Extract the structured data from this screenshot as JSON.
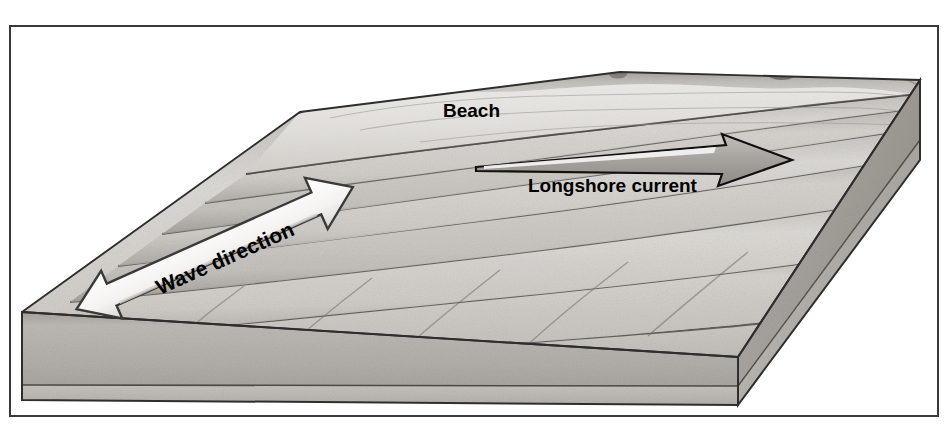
{
  "figure": {
    "type": "geomorphology-block-diagram",
    "medium": "pencil-shaded grayscale illustration",
    "frame": {
      "border_color": "#3a3a3a",
      "border_width_px": 2,
      "x": 9,
      "y": 25,
      "width": 930,
      "height": 392
    },
    "background_color": "#ffffff"
  },
  "labels": {
    "beach": {
      "text": "Beach",
      "x": 443,
      "y": 117,
      "font_size": 19,
      "rotation": 0,
      "color": "#000000"
    },
    "longshore_current": {
      "text": "Longshore current",
      "x": 528,
      "y": 192,
      "font_size": 19,
      "rotation": 0,
      "color": "#000000"
    },
    "wave_direction": {
      "text": "Wave direction",
      "x": 160,
      "y": 295,
      "font_size": 21,
      "rotation": -24,
      "color": "#000000"
    }
  },
  "arrows": {
    "longshore_current_arrow": {
      "name": "longshore-current-arrow",
      "direction": "right",
      "style": "slender single-headed",
      "fill": "#a8a8a8",
      "stroke": "#000000",
      "tail_x": 476,
      "tail_y": 166,
      "tip_x": 792,
      "tip_y": 160
    },
    "wave_direction_arrow": {
      "name": "wave-direction-arrow",
      "direction": "double-headed diagonal",
      "style": "wide white ribbon",
      "fill": "#ffffff",
      "stroke": "#333333",
      "tail_x": 72,
      "tail_y": 300,
      "tip_x": 356,
      "tip_y": 198,
      "rotation_deg": -24
    }
  },
  "colors": {
    "sand_light": "#e8e6e2",
    "sand_mid": "#d3d0cb",
    "water_light": "#d8d6d2",
    "water_mid": "#bfbcb7",
    "water_dark": "#9e9b96",
    "block_face": "#b6b3ae",
    "block_face_lower": "#c9c6c1",
    "block_side": "#a9a6a1",
    "outline": "#2e2e2e",
    "dune_crest": "#6e6b66"
  },
  "geometry": {
    "block": {
      "top_left_corner": [
        22,
        312
      ],
      "front_bottom_left": [
        22,
        400
      ],
      "front_bottom_right": [
        738,
        405
      ],
      "right_top_corner": [
        920,
        80
      ],
      "right_lower_corner": [
        920,
        160
      ],
      "shore_top_left": [
        300,
        112
      ],
      "dune_right": [
        920,
        80
      ]
    },
    "wave_bands": 7,
    "front_face_layers": 2
  },
  "features": [
    {
      "name": "dune-ridge",
      "description": "dark stippled dune crest along top of beach"
    },
    {
      "name": "beach-surface",
      "description": "pale sand surface sloping toward water"
    },
    {
      "name": "wave-crest-band",
      "description": "refracted wave crests bending toward shore",
      "count": 7
    },
    {
      "name": "block-front-face",
      "description": "cut-away sediment face with two horizontal layers"
    },
    {
      "name": "block-right-face",
      "description": "cut-away side face of the block"
    },
    {
      "name": "vegetation-clump",
      "description": "small shrub clump on the dune crest at upper right"
    }
  ]
}
